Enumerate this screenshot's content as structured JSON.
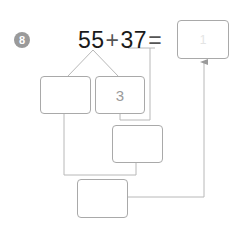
{
  "problem": {
    "number": "8",
    "equation": {
      "first_addend": "55",
      "plus_sign": "+",
      "second_addend": "37",
      "equals_sign": "="
    },
    "answer_box": {
      "value": "",
      "faint_mark": "1"
    },
    "split_boxes": [
      {
        "id": "a",
        "value": ""
      },
      {
        "id": "b",
        "value": "3"
      }
    ],
    "partial_sum_box": {
      "value": ""
    },
    "tens_sum_box": {
      "value": ""
    }
  },
  "colors": {
    "badge": "#9a9a9a",
    "line": "#b8b8b8",
    "box_border": "#a9a9a9",
    "text": "#1a1a1a",
    "hint_text": "#9a9a9a"
  }
}
